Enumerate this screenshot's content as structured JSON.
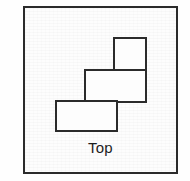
{
  "figure": {
    "caption": "Top",
    "stroke_color": "#2b2b2b",
    "fill_color": "#fdfdfd",
    "frame": {
      "x": 23,
      "y": 6,
      "width": 155,
      "height": 168
    },
    "blocks": [
      {
        "name": "upper-right-square",
        "x": 114,
        "y": 38,
        "width": 32,
        "height": 32
      },
      {
        "name": "middle-rectangle",
        "x": 85,
        "y": 70,
        "width": 61,
        "height": 32
      },
      {
        "name": "lower-left-rectangle",
        "x": 56,
        "y": 101,
        "width": 61,
        "height": 30
      }
    ],
    "outline_points": "114,38 146,38 146,102 117,102 117,131 56,131 56,101 85,101 85,70 114,70",
    "interior_segments": [
      {
        "name": "segment-upper-middle-divider",
        "x1": 114,
        "y1": 70,
        "x2": 146,
        "y2": 70
      },
      {
        "name": "segment-middle-lower-divider",
        "x1": 85,
        "y1": 101,
        "x2": 117,
        "y2": 101
      },
      {
        "name": "segment-middle-left-edge",
        "x1": 85,
        "y1": 70,
        "x2": 85,
        "y2": 101
      }
    ]
  }
}
